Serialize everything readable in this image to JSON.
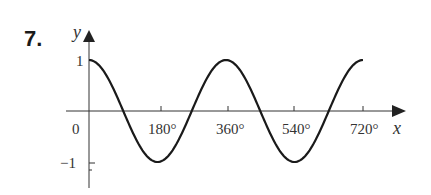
{
  "problem_number": "7.",
  "chart_data": {
    "type": "line",
    "title": "",
    "function": "y = cos(x)",
    "xlabel": "x",
    "ylabel": "y",
    "x_ticks": [
      "180°",
      "360°",
      "540°",
      "720°"
    ],
    "x_tick_values": [
      180,
      360,
      540,
      720
    ],
    "y_ticks": [
      "1",
      "-1"
    ],
    "y_tick_values": [
      1,
      -1
    ],
    "origin_label": "0",
    "xlim": [
      0,
      720
    ],
    "ylim": [
      -1,
      1
    ],
    "grid": false,
    "x": [
      0,
      90,
      180,
      270,
      360,
      450,
      540,
      630,
      720
    ],
    "series": [
      {
        "name": "cos x",
        "values": [
          1,
          0,
          -1,
          0,
          1,
          0,
          -1,
          0,
          1
        ]
      }
    ]
  },
  "labels": {
    "x_axis": "x",
    "y_axis": "y",
    "origin": "0",
    "y_pos": "1",
    "y_neg": "−1",
    "t180": "180°",
    "t360": "360°",
    "t540": "540°",
    "t720": "720°"
  }
}
